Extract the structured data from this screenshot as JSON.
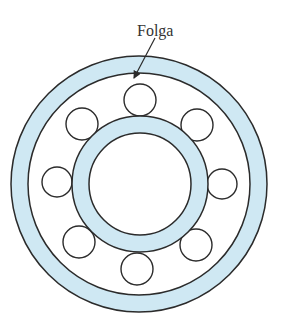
{
  "diagram": {
    "label": "Folga",
    "colors": {
      "ring_fill": "#cfe8f3",
      "stroke": "#2b2b2b",
      "background": "#ffffff"
    },
    "outer_ring": {
      "cx": 139,
      "cy": 184,
      "r_outer": 128,
      "r_inner": 111
    },
    "inner_ring": {
      "cx": 140,
      "cy": 184,
      "r_outer": 68,
      "r_inner": 51
    },
    "balls": [
      {
        "position": "top",
        "cx": 140,
        "cy": 100,
        "r": 16
      },
      {
        "position": "top-right",
        "cx": 197,
        "cy": 125,
        "r": 16
      },
      {
        "position": "right",
        "cx": 222,
        "cy": 184,
        "r": 15
      },
      {
        "position": "bottom-right",
        "cx": 196,
        "cy": 245,
        "r": 16
      },
      {
        "position": "bottom",
        "cx": 137,
        "cy": 269,
        "r": 16
      },
      {
        "position": "bottom-left",
        "cx": 79,
        "cy": 242,
        "r": 16
      },
      {
        "position": "left",
        "cx": 57,
        "cy": 182,
        "r": 15
      },
      {
        "position": "top-left",
        "cx": 82,
        "cy": 124,
        "r": 16
      }
    ],
    "arrow": {
      "x1": 155,
      "y1": 38,
      "x2": 134,
      "y2": 78
    }
  }
}
